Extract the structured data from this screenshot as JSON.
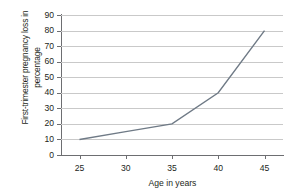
{
  "chart_data": {
    "type": "line",
    "title": "",
    "xlabel": "Age in years",
    "ylabel": "First-trimester pregnancy loss in percentage",
    "ylabel_line1": "First-trimester pregnancy loss in",
    "ylabel_line2": "percentage",
    "x": [
      25,
      30,
      35,
      40,
      45
    ],
    "values": [
      10,
      15,
      20,
      40,
      80
    ],
    "series": [
      {
        "name": "First-trimester pregnancy loss",
        "values": [
          10,
          15,
          20,
          40,
          80
        ]
      }
    ],
    "xlim": [
      23,
      47
    ],
    "ylim": [
      0,
      90
    ],
    "xticks": [
      "25",
      "30",
      "35",
      "40",
      "45"
    ],
    "yticks": [
      "0",
      "10",
      "20",
      "30",
      "40",
      "50",
      "60",
      "70",
      "80",
      "90"
    ],
    "ytick_values": [
      0,
      10,
      20,
      30,
      40,
      50,
      60,
      70,
      80,
      90
    ],
    "grid": "horizontal",
    "legend": "none",
    "line_color": "#6f7a86",
    "grid_color": "#c9c9c9",
    "axis_color": "#6d6e71",
    "text_color": "#231f20",
    "background": "#ffffff"
  }
}
